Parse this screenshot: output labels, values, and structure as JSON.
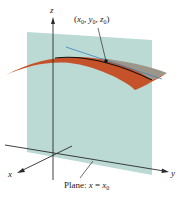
{
  "figure": {
    "axes": {
      "x_label": "x",
      "y_label": "y",
      "z_label": "z"
    },
    "point_label": {
      "open": "(",
      "x": "x",
      "y": "y",
      "z": "z",
      "sub": "0",
      "comma": ", ",
      "close": ")"
    },
    "plane_label": {
      "prefix": "Plane: ",
      "var": "x",
      "eq": " = ",
      "var2": "x",
      "sub": "0"
    },
    "colors": {
      "plane": "#b7d8d2",
      "surface": "#c55228",
      "surface_back": "#9c968a",
      "tangent": "#3d87c0",
      "curve": "#111111",
      "axis": "#2a2a2a"
    }
  }
}
